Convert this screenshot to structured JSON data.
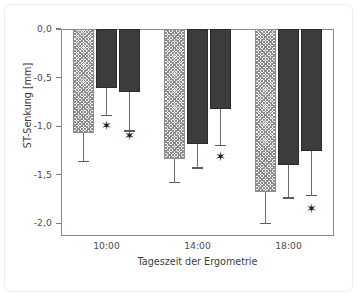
{
  "chart_data": {
    "type": "bar",
    "title": "",
    "xlabel": "Tageszeit der Ergometrie",
    "ylabel": "ST-Senkung [mm]",
    "categories": [
      "10:00",
      "14:00",
      "18:00"
    ],
    "ytick_labels": [
      "0,0",
      "-0,5",
      "-1,0",
      "-1,5",
      "-2,0"
    ],
    "ytick_values": [
      0.0,
      -0.5,
      -1.0,
      -1.5,
      -2.0
    ],
    "ylim": [
      -2.13,
      0.0
    ],
    "grid": false,
    "legend_position": "none",
    "series": [
      {
        "name": "Serie 1 (schraffiert)",
        "style": "hatched",
        "color": "#f2f2f2",
        "values": [
          -1.07,
          -1.34,
          -1.68
        ],
        "errors_lower": [
          -1.36,
          -1.58,
          -2.0
        ],
        "significant": [
          false,
          false,
          false
        ]
      },
      {
        "name": "Serie 2 (dunkel)",
        "style": "solid",
        "color": "#3c3c3c",
        "values": [
          -0.61,
          -1.18,
          -1.4
        ],
        "errors_lower": [
          -0.89,
          -1.43,
          -1.74
        ],
        "significant": [
          true,
          false,
          false
        ]
      },
      {
        "name": "Serie 3 (dunkel)",
        "style": "solid",
        "color": "#3c3c3c",
        "values": [
          -0.65,
          -0.82,
          -1.26
        ],
        "errors_lower": [
          -1.05,
          -1.2,
          -1.71
        ],
        "significant": [
          true,
          true,
          true
        ]
      }
    ],
    "significance_marker": "✶",
    "annotations": [
      {
        "marker": "✶",
        "group": "10:00",
        "series": 2,
        "y": -0.99
      },
      {
        "marker": "✶",
        "group": "10:00",
        "series": 3,
        "y": -1.09
      },
      {
        "marker": "✶",
        "group": "14:00",
        "series": 3,
        "y": -1.31
      },
      {
        "marker": "✶",
        "group": "18:00",
        "series": 3,
        "y": -1.84
      }
    ]
  },
  "colors": {
    "axis": "#7d7d7d",
    "frame": "#ececec",
    "bar_solid": "#3c3c3c",
    "bar_hatch_bg": "#f2f2f2",
    "bar_hatch_line": "#8c8c8c",
    "errorbar": "#6f6f6f",
    "text": "#4a4a4a",
    "background": "#ffffff"
  }
}
